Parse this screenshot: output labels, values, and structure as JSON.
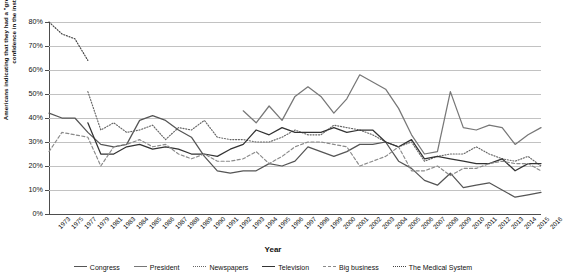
{
  "axes": {
    "ylabel": "Americans indicating that they had a \"great deal\" or \"quite a lot\" of confidence in the institution.",
    "xlabel": "Year",
    "yticks": [
      "0%",
      "10%",
      "20%",
      "30%",
      "40%",
      "50%",
      "60%",
      "70%",
      "80%"
    ]
  },
  "chart_data": {
    "type": "line",
    "title": "",
    "xlabel": "Year",
    "ylabel": "Americans indicating that they had a \"great deal\" or \"quite a lot\" of confidence in the institution.",
    "ylim": [
      0,
      80
    ],
    "yticks": [
      0,
      10,
      20,
      30,
      40,
      50,
      60,
      70,
      80
    ],
    "ytick_labels": [
      "0%",
      "10%",
      "20%",
      "30%",
      "40%",
      "50%",
      "60%",
      "70%",
      "80%"
    ],
    "grid": true,
    "legend_position": "bottom",
    "categories": [
      "1973",
      "1975",
      "1977",
      "1979",
      "1981",
      "1983",
      "1984",
      "1985",
      "1986",
      "1987",
      "1988",
      "1989",
      "1990",
      "1991",
      "1992",
      "1993",
      "1994",
      "1995",
      "1996",
      "1997",
      "1998",
      "1999",
      "2000",
      "2001",
      "2002",
      "2003",
      "2004",
      "2005",
      "2006",
      "2007",
      "2008",
      "2009",
      "2010",
      "2011",
      "2012",
      "2013",
      "2014",
      "2015",
      "2016"
    ],
    "series": [
      {
        "name": "Congress",
        "style": "solid",
        "color": "#555555",
        "values": [
          42,
          40,
          40,
          34,
          29,
          28,
          29,
          39,
          41,
          39,
          35,
          32,
          24,
          18,
          17,
          18,
          18,
          21,
          20,
          22,
          28,
          26,
          24,
          26,
          29,
          29,
          30,
          22,
          19,
          14,
          12,
          17,
          11,
          12,
          13,
          10,
          7,
          8,
          9
        ]
      },
      {
        "name": "President",
        "style": "solid",
        "color": "#777777",
        "values": [
          33,
          null,
          null,
          null,
          null,
          null,
          null,
          null,
          null,
          null,
          null,
          null,
          null,
          null,
          null,
          43,
          38,
          45,
          39,
          49,
          53,
          49,
          42,
          48,
          58,
          55,
          52,
          44,
          33,
          25,
          26,
          51,
          36,
          35,
          37,
          36,
          29,
          33,
          36
        ]
      },
      {
        "name": "Newspapers",
        "style": "dotted",
        "color": "#666666",
        "values": [
          39,
          null,
          null,
          51,
          35,
          38,
          34,
          35,
          37,
          31,
          36,
          35,
          39,
          32,
          31,
          31,
          30,
          30,
          32,
          35,
          33,
          33,
          37,
          36,
          35,
          33,
          30,
          28,
          30,
          22,
          24,
          25,
          25,
          28,
          25,
          23,
          22,
          24,
          20
        ]
      },
      {
        "name": "Television",
        "style": "solid",
        "color": "#333333",
        "values": [
          37,
          null,
          null,
          38,
          25,
          25,
          28,
          29,
          27,
          28,
          27,
          25,
          25,
          24,
          27,
          29,
          35,
          33,
          36,
          34,
          34,
          34,
          36,
          34,
          35,
          35,
          30,
          28,
          31,
          23,
          24,
          23,
          22,
          21,
          21,
          23,
          18,
          21,
          21
        ]
      },
      {
        "name": "Big business",
        "style": "dashed",
        "color": "#8a8a8a",
        "values": [
          26,
          34,
          33,
          32,
          20,
          28,
          29,
          31,
          28,
          29,
          25,
          23,
          25,
          22,
          22,
          23,
          26,
          21,
          24,
          28,
          30,
          30,
          29,
          28,
          20,
          22,
          24,
          28,
          18,
          18,
          20,
          16,
          19,
          19,
          21,
          22,
          21,
          21,
          18
        ]
      },
      {
        "name": "The Medical System",
        "style": "dotted",
        "color": "#444444",
        "values": [
          80,
          75,
          73,
          64,
          null,
          null,
          null,
          null,
          null,
          null,
          null,
          null,
          null,
          null,
          null,
          null,
          null,
          null,
          null,
          null,
          null,
          null,
          null,
          null,
          null,
          null,
          null,
          null,
          null,
          null,
          null,
          null,
          null,
          null,
          null,
          null,
          null,
          null,
          null
        ]
      },
      {
        "name": "The Military",
        "style": "solid",
        "color": "#4a4a4a",
        "values": [
          52,
          null,
          null,
          null,
          null,
          null,
          null,
          null,
          null,
          null,
          null,
          null,
          null,
          72,
          null,
          null,
          null,
          null,
          null,
          null,
          null,
          null,
          null,
          null,
          null,
          null,
          null,
          null,
          null,
          null,
          null,
          null,
          null,
          null,
          null,
          null,
          null,
          null,
          null
        ]
      }
    ]
  },
  "legend": {
    "items": [
      {
        "label": "Congress"
      },
      {
        "label": "President"
      },
      {
        "label": "Newspapers"
      },
      {
        "label": "Television"
      },
      {
        "label": "Big business"
      },
      {
        "label": "The Medical System"
      }
    ]
  }
}
